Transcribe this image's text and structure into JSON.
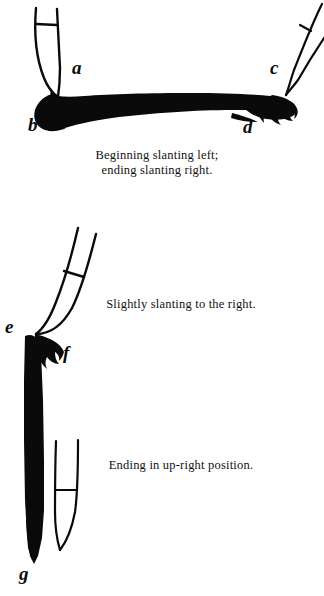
{
  "page": {
    "background_color": "#ffffff",
    "ink_color": "#000000",
    "width": 324,
    "height": 596
  },
  "figures": [
    {
      "id": "figure-horizontal-stroke",
      "caption": "Beginning slanting left;\nending slanting right.",
      "labels": [
        {
          "id": "a",
          "text": "a"
        },
        {
          "id": "b",
          "text": "b"
        },
        {
          "id": "c",
          "text": "c"
        },
        {
          "id": "d",
          "text": "d"
        }
      ],
      "elements": [
        "pen-nib-left-slanting-left",
        "pen-nib-right-slanting-right",
        "horizontal-brush-stroke"
      ]
    },
    {
      "id": "figure-slanting-right-stroke",
      "caption": "Slightly slanting to the right.",
      "labels": [
        {
          "id": "e",
          "text": "e"
        },
        {
          "id": "f",
          "text": "f"
        }
      ],
      "elements": [
        "pen-nib-slanting-right",
        "vertical-brush-stroke"
      ]
    },
    {
      "id": "figure-upright-stroke",
      "caption": "Ending in up-right position.",
      "labels": [
        {
          "id": "g",
          "text": "g"
        }
      ],
      "elements": [
        "pen-nib-upright",
        "vertical-brush-stroke-taper"
      ]
    }
  ]
}
